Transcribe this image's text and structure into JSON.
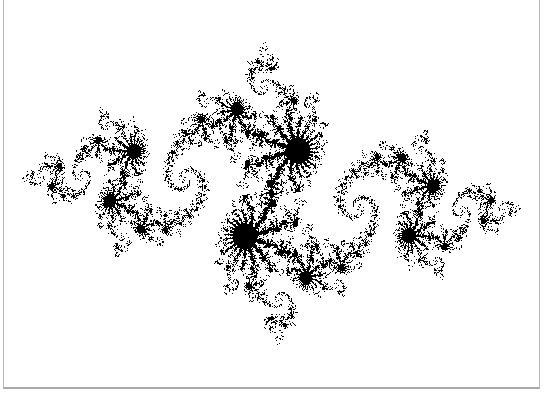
{
  "image": {
    "subject": "Julia set fractal",
    "description": "Black filled Julia set on white background, 2-fold rotational symmetry, horizontally elongated with dendritic arms",
    "fill_color": "#000000",
    "background_color": "#ffffff",
    "border_color": "#b8b8b8"
  },
  "render": {
    "c_re": -0.8,
    "c_im": 0.156,
    "x_min": -1.62,
    "x_max": 1.62,
    "y_min": -1.08,
    "y_max": 1.08,
    "max_iter": 160
  }
}
